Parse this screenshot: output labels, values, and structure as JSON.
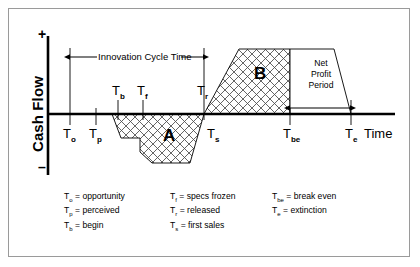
{
  "figure": {
    "type": "innovation-cash-flow-diagram",
    "axes": {
      "y_label": "Cash Flow",
      "y_positive_sign": "+",
      "y_negative_sign": "–",
      "x_label": "Time"
    },
    "regions": [
      {
        "id": "A",
        "label": "A",
        "sign": "negative",
        "description": "investment / negative cash flow area"
      },
      {
        "id": "B",
        "label": "B",
        "sign": "positive",
        "description": "return / positive cash flow area"
      }
    ],
    "spans": [
      {
        "name": "innovation-cycle-time",
        "label": "Innovation Cycle Time",
        "from": "T_o",
        "to": "T_r"
      },
      {
        "name": "net-profit-period",
        "label_lines": [
          "Net",
          "Profit",
          "Period"
        ],
        "from": "T_be",
        "to": "T_e"
      }
    ],
    "milestones": [
      {
        "key": "To",
        "label": "T",
        "sub": "o",
        "above_axis": false
      },
      {
        "key": "Tp",
        "label": "T",
        "sub": "p",
        "above_axis": false
      },
      {
        "key": "Tb",
        "label": "T",
        "sub": "b",
        "above_axis": true
      },
      {
        "key": "Tf",
        "label": "T",
        "sub": "f",
        "above_axis": true
      },
      {
        "key": "Tr",
        "label": "T",
        "sub": "r",
        "above_axis": true
      },
      {
        "key": "Ts",
        "label": "T",
        "sub": "s",
        "above_axis": false
      },
      {
        "key": "Tbe",
        "label": "T",
        "sub": "be",
        "above_axis": false
      },
      {
        "key": "Te",
        "label": "T",
        "sub": "e",
        "above_axis": false
      }
    ],
    "legend": {
      "columns": [
        [
          {
            "sym": "T",
            "sub": "o",
            "text": "= opportunity"
          },
          {
            "sym": "T",
            "sub": "p",
            "text": "= perceived"
          },
          {
            "sym": "T",
            "sub": "b",
            "text": "= begin"
          }
        ],
        [
          {
            "sym": "T",
            "sub": "f",
            "text": "= specs frozen"
          },
          {
            "sym": "T",
            "sub": "r",
            "text": "= released"
          },
          {
            "sym": "T",
            "sub": "s",
            "text": "= first sales"
          }
        ],
        [
          {
            "sym": "T",
            "sub": "be",
            "text": "= break even"
          },
          {
            "sym": "T",
            "sub": "e",
            "text": "= extinction"
          }
        ]
      ]
    },
    "colors": {
      "ink": "#000000",
      "frame": "#9a9a9a",
      "hatch": "#3a3a3a",
      "background": "#ffffff"
    }
  }
}
